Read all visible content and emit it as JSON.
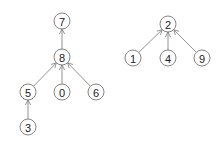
{
  "diagram": {
    "type": "forest",
    "colors": {
      "background": "#ffffff",
      "stroke": "#777777",
      "text": "#222222"
    },
    "node_radius": 8,
    "nodes": [
      {
        "id": "7",
        "label": "7",
        "x": 62,
        "y": 21
      },
      {
        "id": "8",
        "label": "8",
        "x": 62,
        "y": 57
      },
      {
        "id": "5",
        "label": "5",
        "x": 28,
        "y": 92
      },
      {
        "id": "0",
        "label": "0",
        "x": 62,
        "y": 92
      },
      {
        "id": "6",
        "label": "6",
        "x": 96,
        "y": 92
      },
      {
        "id": "3",
        "label": "3",
        "x": 28,
        "y": 127
      },
      {
        "id": "2",
        "label": "2",
        "x": 168,
        "y": 24
      },
      {
        "id": "1",
        "label": "1",
        "x": 133,
        "y": 58
      },
      {
        "id": "4",
        "label": "4",
        "x": 168,
        "y": 58
      },
      {
        "id": "9",
        "label": "9",
        "x": 202,
        "y": 58
      }
    ],
    "edges": [
      {
        "from": "8",
        "to": "7"
      },
      {
        "from": "5",
        "to": "8"
      },
      {
        "from": "0",
        "to": "8"
      },
      {
        "from": "6",
        "to": "8"
      },
      {
        "from": "3",
        "to": "5"
      },
      {
        "from": "1",
        "to": "2"
      },
      {
        "from": "4",
        "to": "2"
      },
      {
        "from": "9",
        "to": "2"
      }
    ],
    "trees": [
      {
        "root": "7",
        "members": [
          "7",
          "8",
          "5",
          "0",
          "6",
          "3"
        ]
      },
      {
        "root": "2",
        "members": [
          "2",
          "1",
          "4",
          "9"
        ]
      }
    ]
  }
}
